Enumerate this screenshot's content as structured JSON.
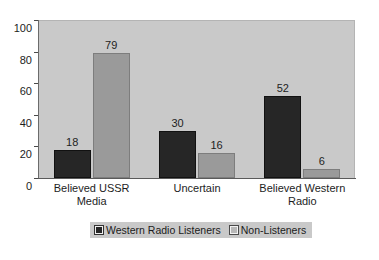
{
  "chart_data": {
    "type": "bar",
    "title": "",
    "xlabel": "",
    "ylabel": "",
    "ylim": [
      0,
      100
    ],
    "yticks": [
      0,
      20,
      40,
      60,
      80,
      100
    ],
    "grid": false,
    "legend_position": "bottom-center",
    "categories": [
      "Believed USSR Media",
      "Uncertain",
      "Believed Western Radio"
    ],
    "category_lines": [
      [
        "Believed USSR",
        "Media"
      ],
      [
        "Uncertain"
      ],
      [
        "Believed Western",
        "Radio"
      ]
    ],
    "series": [
      {
        "name": "Western Radio Listeners",
        "color": "#262626",
        "values": [
          18,
          30,
          52
        ]
      },
      {
        "name": "Non-Listeners",
        "color": "#9a9a9a",
        "values": [
          79,
          16,
          6
        ]
      }
    ]
  },
  "colors": {
    "page_background": "#ffffff",
    "plot_background": "#c9c9c9",
    "legend_background": "#c9c9c9",
    "axis": "#5a5a5a",
    "text": "#1d1d1d",
    "series_0": "#262626",
    "series_1": "#9a9a9a"
  }
}
